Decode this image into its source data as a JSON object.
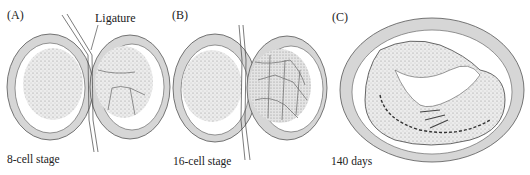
{
  "figure": {
    "panels": [
      {
        "id": "A",
        "letter": "(A)",
        "caption": "8-cell stage",
        "annotation": "Ligature"
      },
      {
        "id": "B",
        "letter": "(B)",
        "caption": "16-cell stage"
      },
      {
        "id": "C",
        "letter": "(C)",
        "caption": "140 days"
      }
    ],
    "colors": {
      "membrane": "#d6d6d6",
      "outline": "#444444",
      "stipple": "#bdbdbd",
      "background": "#ffffff"
    }
  }
}
